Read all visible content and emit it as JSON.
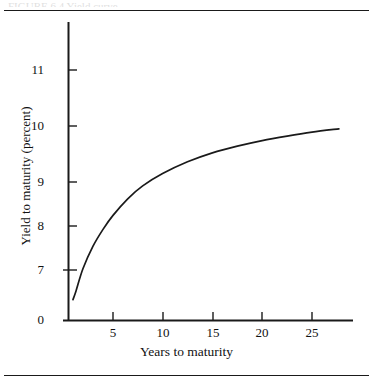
{
  "figure": {
    "top_cut_caption": "FIGURE 6.4   Yield curve",
    "background_color": "#ffffff",
    "line_color": "#1a1a1a"
  },
  "chart_data": {
    "type": "line",
    "title": "",
    "xlabel": "Years to maturity",
    "ylabel": "Yield to maturity (percent)",
    "xlim": [
      0,
      29.2
    ],
    "ylim": [
      0,
      11.6
    ],
    "grid": false,
    "legend": null,
    "x_ticks": [
      0,
      5,
      10,
      15,
      20,
      25
    ],
    "x_tick_labels": [
      "0",
      "5",
      "10",
      "15",
      "20",
      "25"
    ],
    "y_ticks": [
      0,
      7,
      8,
      9,
      10,
      11
    ],
    "y_tick_labels": [
      "0",
      "7",
      "8",
      "9",
      "10",
      "11"
    ],
    "series": [
      {
        "name": "Yield curve",
        "x": [
          1.0,
          1.3,
          2.0,
          3.0,
          4.0,
          5.0,
          6.5,
          8.0,
          10.0,
          12.5,
          15.0,
          17.5,
          20.0,
          22.5,
          25.0,
          27.7
        ],
        "y": [
          6.9,
          7.05,
          7.45,
          7.85,
          8.15,
          8.4,
          8.7,
          8.93,
          9.15,
          9.36,
          9.52,
          9.64,
          9.74,
          9.82,
          9.89,
          9.95
        ]
      }
    ]
  },
  "axis_titles": {
    "x": "Years to maturity",
    "y": "Yield to maturity (percent)"
  }
}
